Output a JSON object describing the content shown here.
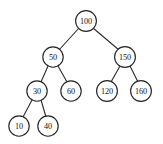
{
  "figure": {
    "background_color": "#ffffff",
    "node_fill_color": "#ffffff",
    "node_stroke_color": "#262626",
    "edge_color": "#2b2b2b",
    "label_color": "#111111",
    "node_radius": 10.2
  },
  "chart_data": {
    "type": "diagram",
    "diagram_kind": "binary-search-tree",
    "title": "",
    "root": "100",
    "nodes": [
      {
        "id": "n100",
        "label": "100",
        "value": 100,
        "x": 86,
        "y": 21,
        "r": 10.4,
        "level": 0,
        "side": "root"
      },
      {
        "id": "n50",
        "label": "50",
        "value": 50,
        "x": 53,
        "y": 57,
        "r": 10.2,
        "level": 1,
        "side": "left"
      },
      {
        "id": "n150",
        "label": "150",
        "value": 150,
        "x": 125,
        "y": 57,
        "r": 10.4,
        "level": 1,
        "side": "right"
      },
      {
        "id": "n30",
        "label": "30",
        "value": 30,
        "x": 37,
        "y": 91,
        "r": 10.2,
        "level": 2,
        "side": "left"
      },
      {
        "id": "n60",
        "label": "60",
        "value": 60,
        "x": 71,
        "y": 91,
        "r": 10.2,
        "level": 2,
        "side": "right"
      },
      {
        "id": "n120",
        "label": "120",
        "value": 120,
        "x": 107,
        "y": 91,
        "r": 10.4,
        "level": 2,
        "side": "left"
      },
      {
        "id": "n160",
        "label": "160",
        "value": 160,
        "x": 141,
        "y": 91,
        "r": 10.4,
        "level": 2,
        "side": "right"
      },
      {
        "id": "n10",
        "label": "10",
        "value": 10,
        "x": 19,
        "y": 126,
        "r": 10.2,
        "level": 3,
        "side": "left"
      },
      {
        "id": "n40",
        "label": "40",
        "value": 40,
        "x": 48,
        "y": 126,
        "r": 10.2,
        "level": 3,
        "side": "right"
      }
    ],
    "edges": [
      {
        "id": "e-100-50",
        "from": "n100",
        "to": "n50",
        "x1": 79,
        "y1": 28,
        "x2": 59,
        "y2": 50
      },
      {
        "id": "e-100-150",
        "from": "n100",
        "to": "n150",
        "x1": 93,
        "y1": 28,
        "x2": 119,
        "y2": 50
      },
      {
        "id": "e-50-30",
        "from": "n50",
        "to": "n30",
        "x1": 48,
        "y1": 66,
        "x2": 41,
        "y2": 82
      },
      {
        "id": "e-50-60",
        "from": "n50",
        "to": "n60",
        "x1": 58,
        "y1": 66,
        "x2": 67,
        "y2": 82
      },
      {
        "id": "e-150-120",
        "from": "n150",
        "to": "n120",
        "x1": 120,
        "y1": 66,
        "x2": 111,
        "y2": 82
      },
      {
        "id": "e-150-160",
        "from": "n150",
        "to": "n160",
        "x1": 130,
        "y1": 66,
        "x2": 138,
        "y2": 82
      },
      {
        "id": "e-30-10",
        "from": "n30",
        "to": "n10",
        "x1": 32,
        "y1": 100,
        "x2": 23,
        "y2": 117
      },
      {
        "id": "e-30-40",
        "from": "n30",
        "to": "n40",
        "x1": 41,
        "y1": 100,
        "x2": 46,
        "y2": 117
      }
    ],
    "traversal_inorder": [
      10,
      30,
      40,
      50,
      60,
      100,
      120,
      150,
      160
    ]
  }
}
